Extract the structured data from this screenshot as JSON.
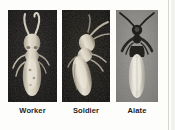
{
  "figure": {
    "name": "termite-caste-plate",
    "background_color": "#fdfdfb"
  },
  "panels": [
    {
      "id": "worker",
      "label": "Worker",
      "subject": "worker-termite",
      "background_color": "#161513",
      "body_color": "#d9d2c2",
      "description": "pale soft-bodied termite, upright, two long curved antennae"
    },
    {
      "id": "soldier",
      "label": "Soldier",
      "subject": "soldier-termite",
      "background_color": "#131210",
      "body_color": "#d7cfbd",
      "description": "pale termite tilted diagonally with darker head and mandibles at upper right"
    },
    {
      "id": "alate",
      "label": "Alate",
      "subject": "alate-termite",
      "background_color": "#8d8c89",
      "body_color": "#e0ddd2",
      "head_color": "#1b1a18",
      "description": "winged reproductive with dark head, spread antennae and long pale wings"
    }
  ]
}
